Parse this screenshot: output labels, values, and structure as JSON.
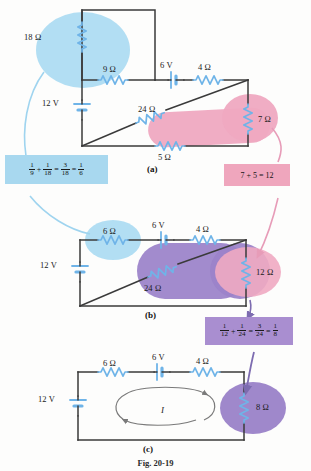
{
  "figure": {
    "caption": "Fig. 20-19",
    "panels": [
      {
        "id": "a",
        "label": "(a)"
      },
      {
        "id": "b",
        "label": "(b)"
      },
      {
        "id": "c",
        "label": "(c)"
      }
    ]
  },
  "colors": {
    "wire": "#3a3a3a",
    "resistor": "#6fb4e8",
    "blue_highlight": "#aedcf2",
    "pink_highlight": "#efa9c1",
    "purple_highlight": "#9b82c9",
    "pink_ellipse": "#f0aac2",
    "purple_ellipse": "#9a82c8",
    "blue_box": "#a8d8ef",
    "pink_box": "#efa6bd",
    "purple_box": "#a98ed0",
    "leader_blue": "#9fd4ef",
    "leader_pink": "#e79cb8",
    "leader_purple": "#7d6cb0",
    "current_arrow": "#7a7a7a"
  },
  "panel_a": {
    "label": "(a)",
    "components": {
      "r18": "18 Ω",
      "r9": "9 Ω",
      "v6": "6 V",
      "r4": "4 Ω",
      "v12": "12 V",
      "r24": "24 Ω",
      "r7": "7 Ω",
      "r5": "5 Ω"
    }
  },
  "panel_b": {
    "label": "(b)",
    "components": {
      "r6": "6 Ω",
      "v6": "6 V",
      "r4": "4 Ω",
      "v12": "12 V",
      "r24": "24 Ω",
      "r12": "12 Ω"
    }
  },
  "panel_c": {
    "label": "(c)",
    "components": {
      "r6": "6 Ω",
      "v6": "6 V",
      "r4": "4 Ω",
      "v12": "12 V",
      "r8": "8 Ω",
      "current": "I"
    }
  },
  "callouts": {
    "blue": {
      "name": "parallel-9-18-equation",
      "parts": {
        "f1_num": "1",
        "f1_den": "9",
        "op1": "+",
        "f2_num": "1",
        "f2_den": "18",
        "op2": "=",
        "f3_num": "3",
        "f3_den": "18",
        "op3": "=",
        "f4_num": "1",
        "f4_den": "6"
      },
      "plain": "1/9 + 1/18 = 3/18 = 1/6"
    },
    "pink": {
      "name": "series-7-5-equation",
      "text": "7 + 5 = 12"
    },
    "purple": {
      "name": "parallel-12-24-equation",
      "parts": {
        "f1_num": "1",
        "f1_den": "12",
        "op1": "+",
        "f2_num": "1",
        "f2_den": "24",
        "op2": "=",
        "f3_num": "3",
        "f3_den": "24",
        "op3": "=",
        "f4_num": "1",
        "f4_den": "8"
      },
      "plain": "1/12 + 1/24 = 3/24 = 1/8"
    }
  }
}
